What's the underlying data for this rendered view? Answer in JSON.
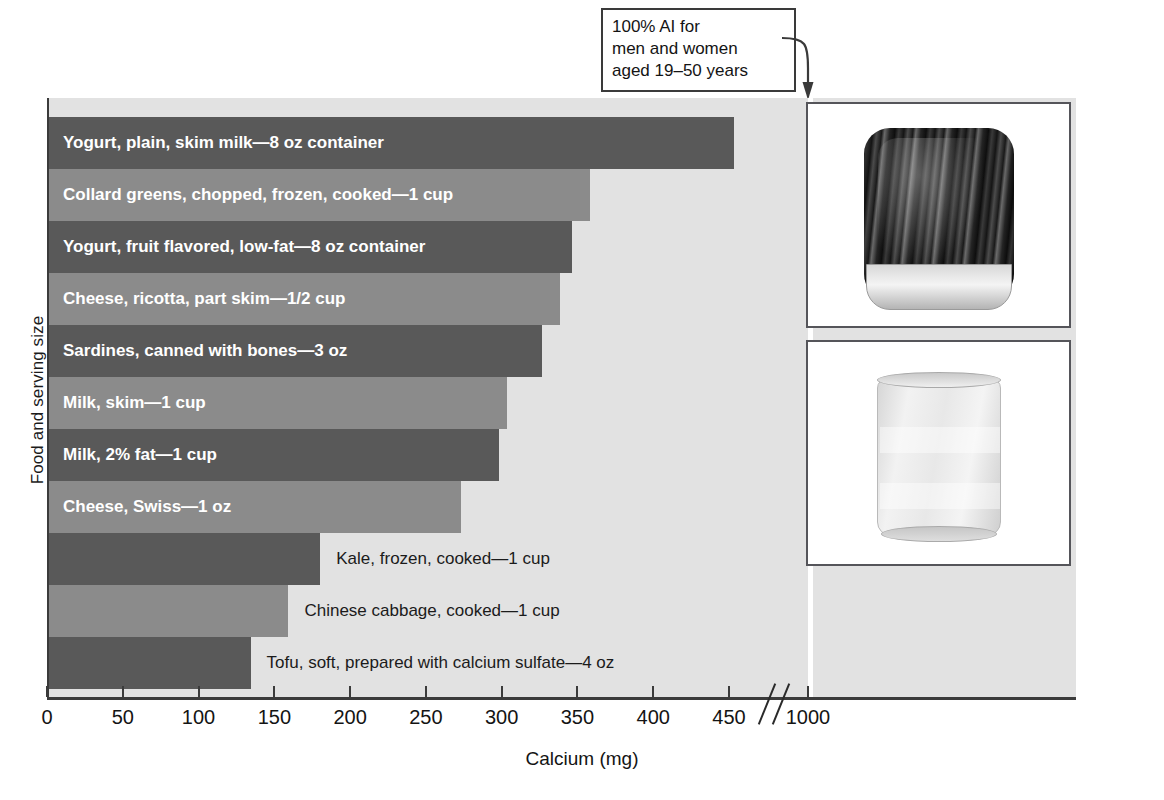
{
  "chart_data": {
    "type": "bar",
    "orientation": "horizontal",
    "title": "",
    "xlabel": "Calcium (mg)",
    "ylabel": "Food and serving size",
    "xlim": [
      0,
      1000
    ],
    "axis_break": true,
    "axis_break_between": [
      460,
      1000
    ],
    "grid": false,
    "tick_labels": [
      "0",
      "50",
      "100",
      "150",
      "200",
      "250",
      "300",
      "350",
      "400",
      "450",
      "1000"
    ],
    "tick_values": [
      0,
      50,
      100,
      150,
      200,
      250,
      300,
      350,
      400,
      450,
      1000
    ],
    "categories": [
      "Yogurt, plain, skim milk—8 oz container",
      "Collard greens, chopped, frozen, cooked—1 cup",
      "Yogurt, fruit flavored, low-fat—8 oz container",
      "Cheese, ricotta, part skim—1/2 cup",
      "Sardines, canned with bones—3 oz",
      "Milk, skim—1 cup",
      "Milk, 2% fat—1 cup",
      "Cheese, Swiss—1 oz",
      "Kale, frozen, cooked—1 cup",
      "Chinese cabbage, cooked—1 cup",
      "Tofu, soft, prepared with calcium sulfate—4 oz"
    ],
    "values": [
      452,
      357,
      345,
      337,
      325,
      302,
      297,
      272,
      179,
      158,
      133
    ],
    "bars": [
      {
        "label": "Yogurt, plain, skim milk—8 oz container",
        "value": 452,
        "shade": "dark",
        "label_position": "inside"
      },
      {
        "label": "Collard greens, chopped, frozen, cooked—1 cup",
        "value": 357,
        "shade": "light",
        "label_position": "inside"
      },
      {
        "label": "Yogurt, fruit flavored, low-fat—8 oz container",
        "value": 345,
        "shade": "dark",
        "label_position": "inside"
      },
      {
        "label": "Cheese, ricotta, part skim—1/2 cup",
        "value": 337,
        "shade": "light",
        "label_position": "inside"
      },
      {
        "label": "Sardines, canned with bones—3 oz",
        "value": 325,
        "shade": "dark",
        "label_position": "inside"
      },
      {
        "label": "Milk, skim—1 cup",
        "value": 302,
        "shade": "light",
        "label_position": "inside"
      },
      {
        "label": "Milk, 2% fat—1 cup",
        "value": 297,
        "shade": "dark",
        "label_position": "inside"
      },
      {
        "label": "Cheese, Swiss—1 oz",
        "value": 272,
        "shade": "light",
        "label_position": "inside"
      },
      {
        "label": "Kale, frozen, cooked—1 cup",
        "value": 179,
        "shade": "dark",
        "label_position": "outside"
      },
      {
        "label": "Chinese cabbage, cooked—1 cup",
        "value": 158,
        "shade": "light",
        "label_position": "outside"
      },
      {
        "label": "Tofu, soft, prepared with calcium sulfate—4 oz",
        "value": 133,
        "shade": "dark",
        "label_position": "outside"
      }
    ],
    "reference_line": {
      "value": 1000,
      "color": "#ffffff",
      "annotation_lines": [
        "100% AI for",
        "men and women",
        "aged 19–50 years"
      ]
    },
    "colors": {
      "bar_dark": "#595959",
      "bar_light": "#8b8b8b",
      "plot_background": "#e2e2e2",
      "axis": "#3b3b3b",
      "reference_line": "#ffffff",
      "label_inside": "#ffffff",
      "label_outside": "#1b1b1b"
    }
  },
  "callout": {
    "line1": "100% AI for",
    "line2": "men and women",
    "line3": "aged 19–50 years"
  },
  "axis": {
    "x_title": "Calcium (mg)",
    "y_title": "Food and serving size"
  },
  "photos": [
    {
      "name": "sardines-can-photo",
      "caption": ""
    },
    {
      "name": "glass-of-milk-photo",
      "caption": ""
    }
  ]
}
